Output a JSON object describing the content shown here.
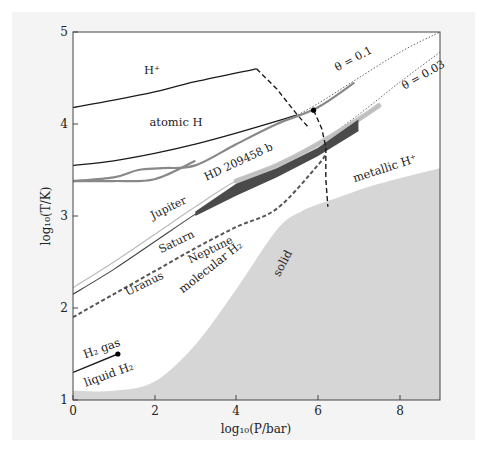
{
  "chart_data": {
    "type": "line",
    "title": "",
    "xlabel": "log10(P/bar)",
    "ylabel": "log10(T/K)",
    "xlim": [
      0,
      9
    ],
    "ylim": [
      1,
      5
    ],
    "x_ticks": [
      0,
      2,
      4,
      6,
      8
    ],
    "y_ticks": [
      1,
      2,
      3,
      4,
      5
    ],
    "grid": false,
    "regions": [
      {
        "name": "H+",
        "label": "H⁺",
        "x": 1.9,
        "y": 4.55
      },
      {
        "name": "atomic H",
        "label": "atomic H",
        "x": 2.2,
        "y": 3.95
      },
      {
        "name": "metallic H+",
        "label": "metallic H⁺",
        "x": 7.3,
        "y": 3.65
      },
      {
        "name": "molecular H2",
        "label": "molecular H₂",
        "x": 2.9,
        "y": 2.25
      },
      {
        "name": "solid",
        "label": "solid",
        "x": 5.7,
        "y": 2.6
      },
      {
        "name": "H2 gas",
        "label": "H₂ gas",
        "x": 0.75,
        "y": 1.58
      },
      {
        "name": "liquid H2",
        "label": "liquid H₂",
        "x": 0.8,
        "y": 1.3
      }
    ],
    "series": [
      {
        "name": "H+ / atomic H boundary",
        "style": "solid",
        "color": "#1a1a1a",
        "points": [
          [
            0,
            4.18
          ],
          [
            1,
            4.26
          ],
          [
            2,
            4.35
          ],
          [
            3,
            4.46
          ],
          [
            4.5,
            4.6
          ]
        ]
      },
      {
        "name": "H+ / metallic dissociation (dashed)",
        "style": "dashed",
        "color": "#1a1a1a",
        "points": [
          [
            4.5,
            4.6
          ],
          [
            5,
            4.38
          ],
          [
            5.5,
            4.1
          ],
          [
            5.8,
            3.95
          ]
        ]
      },
      {
        "name": "atomic H / molecular H boundary",
        "style": "solid",
        "color": "#1a1a1a",
        "points": [
          [
            0,
            3.55
          ],
          [
            1,
            3.6
          ],
          [
            2,
            3.68
          ],
          [
            3,
            3.78
          ],
          [
            4,
            3.9
          ],
          [
            5,
            4.03
          ],
          [
            5.5,
            4.1
          ]
        ]
      },
      {
        "name": "plasma phase transition (dashed)",
        "style": "dashed",
        "color": "#1a1a1a",
        "points": [
          [
            5.9,
            4.15
          ],
          [
            6.1,
            3.95
          ],
          [
            6.2,
            3.75
          ],
          [
            6.2,
            3.4
          ],
          [
            6.25,
            3.1
          ]
        ]
      },
      {
        "name": "theta = 0.1",
        "style": "dotted",
        "color": "#555555",
        "label": "θ = 0.1",
        "points": [
          [
            5.3,
            4.05
          ],
          [
            6,
            4.22
          ],
          [
            7,
            4.5
          ],
          [
            8.1,
            4.8
          ],
          [
            9,
            5.0
          ]
        ]
      },
      {
        "name": "theta = 0.03",
        "style": "dotted",
        "color": "#555555",
        "label": "θ = 0.03",
        "points": [
          [
            6.0,
            3.78
          ],
          [
            7,
            4.1
          ],
          [
            8,
            4.45
          ],
          [
            9,
            4.78
          ]
        ]
      },
      {
        "name": "HD 209458 b (upper)",
        "style": "solid",
        "color": "#888888",
        "label": "HD 209458 b",
        "points": [
          [
            0,
            3.38
          ],
          [
            1,
            3.42
          ],
          [
            1.6,
            3.5
          ],
          [
            2.2,
            3.52
          ],
          [
            3,
            3.55
          ],
          [
            4,
            3.78
          ],
          [
            5,
            4.0
          ],
          [
            6,
            4.18
          ],
          [
            6.9,
            4.45
          ]
        ]
      },
      {
        "name": "HD 209458 b (lower)",
        "style": "solid",
        "color": "#888888",
        "points": [
          [
            0,
            3.38
          ],
          [
            1,
            3.38
          ],
          [
            2,
            3.4
          ],
          [
            3,
            3.6
          ]
        ]
      },
      {
        "name": "Jupiter",
        "style": "solid",
        "color": "#bbbbbb",
        "label": "Jupiter",
        "points": [
          [
            0,
            2.22
          ],
          [
            1,
            2.5
          ],
          [
            2,
            2.8
          ],
          [
            3,
            3.1
          ],
          [
            4,
            3.38
          ],
          [
            5,
            3.55
          ],
          [
            6,
            3.78
          ],
          [
            7,
            4.05
          ],
          [
            7.5,
            4.2
          ]
        ]
      },
      {
        "name": "Saturn",
        "style": "solid",
        "color": "#444444",
        "label": "Saturn",
        "points": [
          [
            0,
            2.15
          ],
          [
            1,
            2.42
          ],
          [
            2,
            2.72
          ],
          [
            3,
            3.02
          ],
          [
            4,
            3.3
          ],
          [
            5,
            3.5
          ],
          [
            6,
            3.72
          ],
          [
            6.9,
            4.0
          ]
        ]
      },
      {
        "name": "Uranus / Neptune",
        "style": "dashed",
        "color": "#555555",
        "labels": [
          "Uranus",
          "Neptune"
        ],
        "points": [
          [
            0,
            1.9
          ],
          [
            1,
            2.15
          ],
          [
            2,
            2.4
          ],
          [
            3,
            2.65
          ],
          [
            4,
            2.88
          ],
          [
            5,
            3.08
          ],
          [
            6,
            3.55
          ],
          [
            6.2,
            3.68
          ]
        ]
      }
    ],
    "markers": [
      {
        "name": "H2 critical point",
        "x": 1.1,
        "y": 1.5
      },
      {
        "name": "PPT critical point",
        "x": 5.9,
        "y": 4.15
      }
    ],
    "filled_regions": [
      {
        "name": "solid",
        "color": "#d6d6d6",
        "points": [
          [
            0,
            1
          ],
          [
            0,
            1.1
          ],
          [
            1,
            1.1
          ],
          [
            2,
            1.2
          ],
          [
            3,
            1.6
          ],
          [
            4,
            2.2
          ],
          [
            5,
            2.85
          ],
          [
            5.6,
            3.05
          ],
          [
            6.5,
            3.2
          ],
          [
            7.5,
            3.35
          ],
          [
            9,
            3.52
          ],
          [
            9,
            1
          ]
        ]
      }
    ],
    "envelopes": [
      {
        "name": "Jupiter/Saturn interior band",
        "color": "#5a5a5a",
        "points": [
          [
            3,
            3.05
          ],
          [
            4,
            3.35
          ],
          [
            5,
            3.52
          ],
          [
            6,
            3.74
          ],
          [
            7,
            4.05
          ],
          [
            7,
            3.92
          ],
          [
            6,
            3.65
          ],
          [
            5,
            3.42
          ],
          [
            4,
            3.22
          ],
          [
            3,
            3.0
          ]
        ]
      }
    ]
  },
  "axes": {
    "xlabel_text": "log₁₀(P/bar)",
    "ylabel_text": "log₁₀(T/K)",
    "x_tick_labels": [
      "0",
      "2",
      "4",
      "6",
      "8"
    ],
    "y_tick_labels": [
      "1",
      "2",
      "3",
      "4",
      "5"
    ]
  },
  "labels": {
    "h_plus": "H⁺",
    "atomic_h": "atomic H",
    "metallic_h_plus": "metallic H⁺",
    "molecular_h2": "molecular H₂",
    "solid": "solid",
    "h2_gas": "H₂ gas",
    "liquid_h2": "liquid H₂",
    "hd209458b": "HD 209458 b",
    "jupiter": "Jupiter",
    "saturn": "Saturn",
    "uranus": "Uranus",
    "neptune": "Neptune",
    "theta_01": "θ = 0.1",
    "theta_003": "θ = 0.03"
  },
  "colors": {
    "panel_bg": "#f4f4f4",
    "plot_bg": "#ffffff",
    "solid_fill": "#d6d6d6",
    "axis": "#333333",
    "boundary": "#1a1a1a",
    "hd209458b": "#888888",
    "jupiter": "#bbbbbb",
    "saturn": "#444444",
    "band_dark": "#505050",
    "band_light": "#b8b8b8"
  }
}
